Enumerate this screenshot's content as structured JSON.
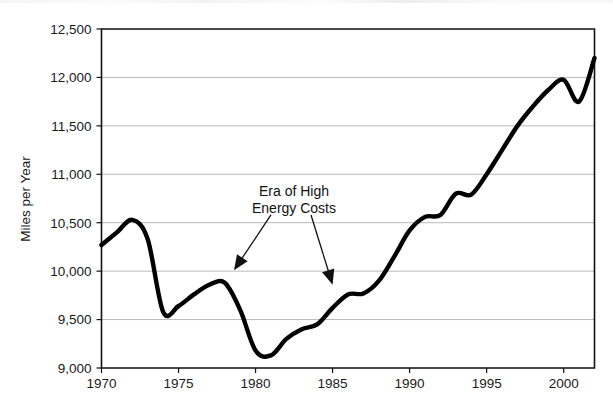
{
  "chart_data": {
    "type": "line",
    "title": "",
    "subtitle": "",
    "xlabel": "",
    "ylabel": "Miles per Year",
    "xlim": [
      1970,
      2002
    ],
    "ylim": [
      9000,
      12500
    ],
    "grid": true,
    "legend": false,
    "legend_position": "none",
    "y_ticks": [
      9000,
      9500,
      10000,
      10500,
      11000,
      11500,
      12000,
      12500
    ],
    "y_tick_labels": [
      "9,000",
      "9,500",
      "10,000",
      "10,500",
      "11,000",
      "11,500",
      "12,000",
      "12,500"
    ],
    "x_ticks": [
      1970,
      1975,
      1980,
      1985,
      1990,
      1995,
      2000
    ],
    "x_tick_labels": [
      "1970",
      "1975",
      "1980",
      "1985",
      "1990",
      "1995",
      "2000"
    ],
    "x_minor_ticks": [
      1970,
      1975,
      1980,
      1985,
      1990,
      1995,
      2000
    ],
    "series": [
      {
        "name": "Miles per Year",
        "color": "#000000",
        "x": [
          1970,
          1971,
          1972,
          1973,
          1974,
          1975,
          1976,
          1977,
          1978,
          1979,
          1980,
          1981,
          1982,
          1983,
          1984,
          1985,
          1986,
          1987,
          1988,
          1989,
          1990,
          1991,
          1992,
          1993,
          1994,
          1995,
          1996,
          1997,
          1998,
          1999,
          2000,
          2001,
          2002
        ],
        "values": [
          10270,
          10400,
          10530,
          10330,
          9580,
          9640,
          9760,
          9860,
          9880,
          9600,
          9180,
          9130,
          9300,
          9400,
          9450,
          9620,
          9760,
          9770,
          9900,
          10150,
          10420,
          10560,
          10580,
          10800,
          10790,
          11000,
          11250,
          11500,
          11700,
          11870,
          11975,
          11750,
          12200
        ]
      }
    ],
    "annotations": [
      {
        "text_line1": "Era of High",
        "text_line2": "Energy Costs",
        "arrows": [
          {
            "label": "arrow-left",
            "from_x": 1981.0,
            "from_y": 10580,
            "to_x": 1978.6,
            "to_y": 10010
          },
          {
            "label": "arrow-right",
            "from_x": 1983.6,
            "from_y": 10580,
            "to_x": 1985.0,
            "to_y": 9860
          }
        ]
      }
    ]
  }
}
